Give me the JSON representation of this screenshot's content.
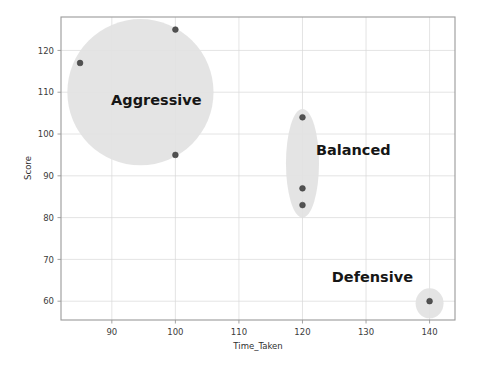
{
  "chart_data": {
    "type": "scatter",
    "title": "",
    "xlabel": "Time_Taken",
    "ylabel": "Score",
    "xlim": [
      82,
      144
    ],
    "ylim": [
      55.5,
      128
    ],
    "xticks": [
      90,
      100,
      110,
      120,
      130,
      140
    ],
    "yticks": [
      60,
      70,
      80,
      90,
      100,
      110,
      120
    ],
    "grid": true,
    "legend": "none",
    "point_color": "#515151",
    "blob_color": "#e2e2e2",
    "clusters": [
      {
        "name": "Aggressive",
        "label": "Aggressive",
        "label_x": 97,
        "label_y": 107,
        "center_x": 94.5,
        "center_y": 110,
        "radius_x": 11.5,
        "radius_y": 17.5,
        "points": [
          {
            "x": 85,
            "y": 117
          },
          {
            "x": 100,
            "y": 125
          },
          {
            "x": 100,
            "y": 95
          }
        ]
      },
      {
        "name": "Balanced",
        "label": "Balanced",
        "label_x": 128,
        "label_y": 95,
        "center_x": 120,
        "center_y": 93,
        "radius_x": 2.6,
        "radius_y": 13,
        "points": [
          {
            "x": 120,
            "y": 104
          },
          {
            "x": 120,
            "y": 87
          },
          {
            "x": 120,
            "y": 83
          }
        ]
      },
      {
        "name": "Defensive",
        "label": "Defensive",
        "label_x": 131,
        "label_y": 64.5,
        "center_x": 140,
        "center_y": 59.5,
        "radius_x": 2.2,
        "radius_y": 3.6,
        "points": [
          {
            "x": 140,
            "y": 60
          }
        ]
      }
    ]
  },
  "axes": {
    "x_title": "Time_Taken",
    "y_title": "Score",
    "x_tick_labels": [
      "90",
      "100",
      "110",
      "120",
      "130",
      "140"
    ],
    "y_tick_labels": [
      "60",
      "70",
      "80",
      "90",
      "100",
      "110",
      "120"
    ]
  },
  "labels": {
    "aggressive": "Aggressive",
    "balanced": "Balanced",
    "defensive": "Defensive"
  }
}
